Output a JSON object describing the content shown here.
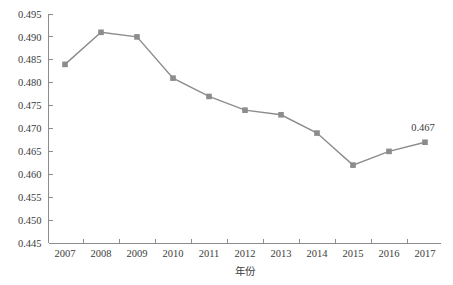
{
  "chart_data": {
    "type": "line",
    "title": "",
    "subtitle": "",
    "xlabel": "年份",
    "ylabel": "",
    "categories": [
      "2007",
      "2008",
      "2009",
      "2010",
      "2011",
      "2012",
      "2013",
      "2014",
      "2015",
      "2016",
      "2017"
    ],
    "values": [
      0.484,
      0.491,
      0.49,
      0.481,
      0.477,
      0.474,
      0.473,
      0.469,
      0.462,
      0.465,
      0.467
    ],
    "ylim": [
      0.445,
      0.495
    ],
    "ytick_labels": [
      "0.495",
      "0.490",
      "0.485",
      "0.480",
      "0.475",
      "0.470",
      "0.465",
      "0.460",
      "0.455",
      "0.450",
      "0.445"
    ],
    "ytick_values": [
      0.495,
      0.49,
      0.485,
      0.48,
      0.475,
      0.47,
      0.465,
      0.46,
      0.455,
      0.45,
      0.445
    ],
    "ytick_step": 0.005,
    "grid": false,
    "legend": false,
    "legend_position": "none",
    "annotations": [
      {
        "label": "0.467",
        "category": "2017",
        "value": 0.467
      }
    ],
    "series_color": "#8c8c8c",
    "marker": "square",
    "axis_color": "#8c8c8c",
    "text_color": "#3c3c3c",
    "background": "#ffffff"
  }
}
